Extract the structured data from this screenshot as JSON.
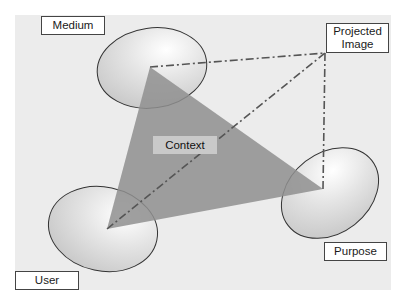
{
  "diagram": {
    "type": "context-triangle",
    "nodes": {
      "medium": "Medium",
      "projected_image": "Projected Image",
      "projected_image_line1": "Projected",
      "projected_image_line2": "Image",
      "user": "User",
      "purpose": "Purpose",
      "context": "Context"
    },
    "colors": {
      "background_panel": "#ececec",
      "triangle_fill": "#9a9a9a",
      "disc_fill": "#d8d8d8",
      "dash_line": "#555555",
      "label_border": "#444444"
    }
  }
}
